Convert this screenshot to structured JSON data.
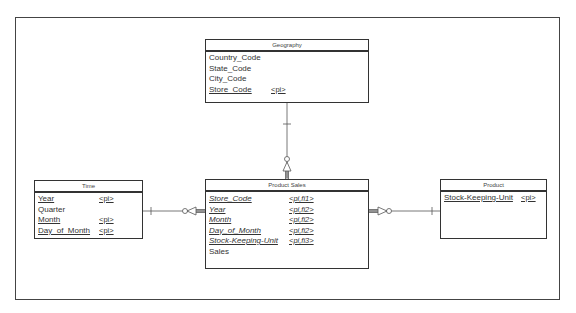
{
  "diagram": {
    "type": "entity-relationship (star schema)",
    "entities": [
      {
        "id": "geography",
        "title": "Geography",
        "attributes": [
          {
            "name": "Country_Code",
            "key": ""
          },
          {
            "name": "State_Code",
            "key": ""
          },
          {
            "name": "City_Code",
            "key": ""
          },
          {
            "name": "Store_Code",
            "key": "<pi>"
          }
        ]
      },
      {
        "id": "time",
        "title": "Time",
        "attributes": [
          {
            "name": "Year",
            "key": "<pi>"
          },
          {
            "name": "Quarter",
            "key": ""
          },
          {
            "name": "Month",
            "key": "<pi>"
          },
          {
            "name": "Day_of_Month",
            "key": "<pi>"
          }
        ]
      },
      {
        "id": "product_sales",
        "title": "Product Sales",
        "attributes": [
          {
            "name": "Store_Code",
            "key": "<pi,fi1>"
          },
          {
            "name": "Year",
            "key": "<pi,fi2>"
          },
          {
            "name": "Month",
            "key": "<pi,fi2>"
          },
          {
            "name": "Day_of_Month",
            "key": "<pi,fi2>"
          },
          {
            "name": "Stock-Keeping-Unit",
            "key": "<pi,fi3>"
          },
          {
            "name": "Sales",
            "key": ""
          }
        ]
      },
      {
        "id": "product",
        "title": "Product",
        "attributes": [
          {
            "name": "Stock-Keeping-Unit",
            "key": "<pi>"
          }
        ]
      }
    ],
    "relationships": [
      {
        "from": "Geography",
        "to": "Product Sales",
        "from_cardinality": "one",
        "to_cardinality": "zero-or-many (identifying)"
      },
      {
        "from": "Time",
        "to": "Product Sales",
        "from_cardinality": "one",
        "to_cardinality": "zero-or-many (identifying)"
      },
      {
        "from": "Product",
        "to": "Product Sales",
        "from_cardinality": "one",
        "to_cardinality": "zero-or-many (identifying)"
      }
    ]
  }
}
